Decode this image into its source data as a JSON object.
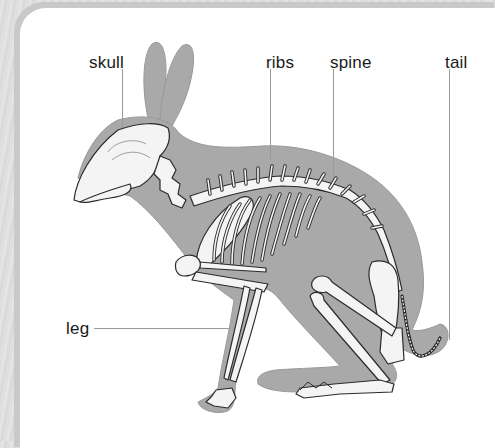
{
  "diagram": {
    "colors": {
      "body_silhouette": "#a9a9a9",
      "bone_fill": "#f4f4f4",
      "bone_outline": "#2b2b2b",
      "leader_line": "#9a9a9a",
      "panel": "#ffffff",
      "frame": "#d9d9d9"
    },
    "labels": [
      {
        "id": "skull",
        "text": "skull"
      },
      {
        "id": "ribs",
        "text": "ribs"
      },
      {
        "id": "spine",
        "text": "spine"
      },
      {
        "id": "tail",
        "text": "tail"
      },
      {
        "id": "leg",
        "text": "leg"
      }
    ]
  }
}
